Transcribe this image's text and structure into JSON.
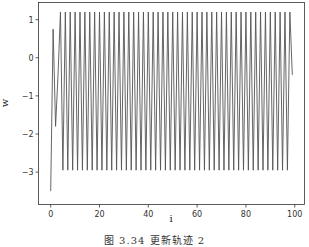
{
  "chart_data": {
    "type": "line",
    "title": "",
    "xlabel": "i",
    "ylabel": "w",
    "xlim": [
      -5,
      104
    ],
    "ylim": [
      -3.85,
      1.45
    ],
    "xticks": [
      0,
      20,
      40,
      60,
      80,
      100
    ],
    "yticks": [
      1,
      0,
      -1,
      -2,
      -3
    ],
    "grid": false,
    "legend": null,
    "line_color": "#555555",
    "series": [
      {
        "name": "w",
        "x_start": 0,
        "x_end": 99,
        "initial_values": [
          -3.5,
          0.75,
          -1.8,
          -0.45
        ],
        "steady_state": {
          "even_index_value": 1.2,
          "odd_index_value": -2.95,
          "from_index": 4,
          "to_index": 98
        },
        "final_value": -0.45
      }
    ]
  },
  "caption": "图 3.34    更新轨迹 2"
}
